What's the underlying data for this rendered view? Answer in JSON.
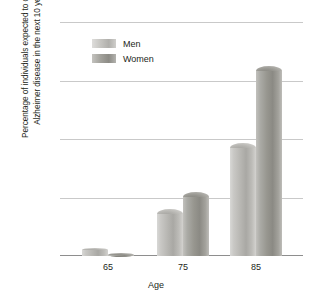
{
  "chart_data": {
    "type": "bar",
    "title": "",
    "xlabel": "Age",
    "ylabel_line1": "Percentage of individuals expected to develop",
    "ylabel_line2": "Alzheimer disease in the next 10 years",
    "categories": [
      "65",
      "75",
      "85"
    ],
    "series": [
      {
        "name": "Men",
        "values": [
          0.7,
          4.0,
          9.7
        ],
        "color": "#b5b4b0"
      },
      {
        "name": "Women",
        "values": [
          0.3,
          5.5,
          16.2
        ],
        "color": "#97968f"
      }
    ],
    "ylim": [
      0,
      20
    ],
    "yticks": [
      "0",
      "5",
      "10",
      "15",
      "20"
    ],
    "ytick_values": [
      0,
      5,
      10,
      15,
      20
    ],
    "grid": true,
    "legend_position": "top-left-inside"
  },
  "axes": {
    "y_ticks": [
      {
        "label": "20",
        "value": 20
      },
      {
        "label": "15",
        "value": 15
      },
      {
        "label": "10",
        "value": 10
      },
      {
        "label": "5",
        "value": 5
      },
      {
        "label": "0",
        "value": 0
      }
    ],
    "x_ticks": [
      {
        "label": "65"
      },
      {
        "label": "75"
      },
      {
        "label": "85"
      }
    ],
    "x_title": "Age",
    "y_title_line1": "Percentage of individuals expected to develop",
    "y_title_line2": "Alzheimer disease in the next 10 years"
  },
  "legend": {
    "items": [
      {
        "label": "Men"
      },
      {
        "label": "Women"
      }
    ]
  },
  "bars": [
    {
      "group": "65",
      "series": "Men",
      "value": 0.7
    },
    {
      "group": "65",
      "series": "Women",
      "value": 0.3
    },
    {
      "group": "75",
      "series": "Men",
      "value": 4.0
    },
    {
      "group": "75",
      "series": "Women",
      "value": 5.5
    },
    {
      "group": "85",
      "series": "Men",
      "value": 9.7
    },
    {
      "group": "85",
      "series": "Women",
      "value": 16.2
    }
  ],
  "colors": {
    "grid": "#c9c9c9",
    "axis": "#8e8e8e",
    "text": "#231f20",
    "background": "#ffffff"
  }
}
